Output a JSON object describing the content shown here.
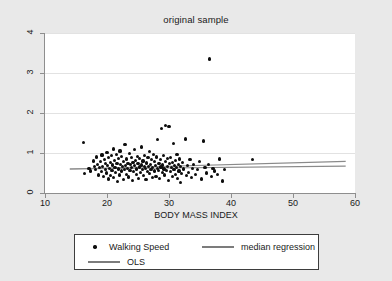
{
  "chart_data": {
    "type": "scatter",
    "title": "original sample",
    "xlabel": "BODY MASS INDEX",
    "ylabel": "",
    "xlim": [
      10,
      60
    ],
    "ylim": [
      0,
      4
    ],
    "xticks": [
      "10",
      "20",
      "30",
      "40",
      "50",
      "60"
    ],
    "yticks": [
      "0",
      "1",
      "2",
      "3",
      "4"
    ],
    "grid": "horizontal",
    "legend_position": "below-plot",
    "series": [
      {
        "name": "Walking Speed",
        "marker": "filled-circle",
        "color": "#0d0d0d",
        "points": [
          [
            16.2,
            1.27
          ],
          [
            16.4,
            0.49
          ],
          [
            17.1,
            0.62
          ],
          [
            17.4,
            0.55
          ],
          [
            17.8,
            0.8
          ],
          [
            18.0,
            0.67
          ],
          [
            18.2,
            0.58
          ],
          [
            18.3,
            0.9
          ],
          [
            18.5,
            0.72
          ],
          [
            18.6,
            0.45
          ],
          [
            18.8,
            0.63
          ],
          [
            19.0,
            0.78
          ],
          [
            19.1,
            0.53
          ],
          [
            19.2,
            0.95
          ],
          [
            19.3,
            0.66
          ],
          [
            19.5,
            0.41
          ],
          [
            19.6,
            0.84
          ],
          [
            19.7,
            0.59
          ],
          [
            19.8,
            0.73
          ],
          [
            19.9,
            0.5
          ],
          [
            20.0,
            1.02
          ],
          [
            20.1,
            0.69
          ],
          [
            20.2,
            0.88
          ],
          [
            20.3,
            0.35
          ],
          [
            20.4,
            0.61
          ],
          [
            20.5,
            0.76
          ],
          [
            20.6,
            0.44
          ],
          [
            20.7,
            0.93
          ],
          [
            20.8,
            0.57
          ],
          [
            20.9,
            0.7
          ],
          [
            21.0,
            1.1
          ],
          [
            21.1,
            0.38
          ],
          [
            21.2,
            0.82
          ],
          [
            21.3,
            0.64
          ],
          [
            21.4,
            0.51
          ],
          [
            21.5,
            0.97
          ],
          [
            21.6,
            0.74
          ],
          [
            21.7,
            0.29
          ],
          [
            21.8,
            0.86
          ],
          [
            21.9,
            0.6
          ],
          [
            22.0,
            0.45
          ],
          [
            22.1,
            1.05
          ],
          [
            22.2,
            0.71
          ],
          [
            22.3,
            0.55
          ],
          [
            22.4,
            0.91
          ],
          [
            22.5,
            0.66
          ],
          [
            22.6,
            0.33
          ],
          [
            22.7,
            0.79
          ],
          [
            22.8,
            0.58
          ],
          [
            22.9,
            1.21
          ],
          [
            23.0,
            0.68
          ],
          [
            23.1,
            0.47
          ],
          [
            23.2,
            0.85
          ],
          [
            23.3,
            0.62
          ],
          [
            23.4,
            0.74
          ],
          [
            23.5,
            0.4
          ],
          [
            23.6,
            0.99
          ],
          [
            23.7,
            0.56
          ],
          [
            23.8,
            0.71
          ],
          [
            23.9,
            0.88
          ],
          [
            24.0,
            0.63
          ],
          [
            24.1,
            0.31
          ],
          [
            24.2,
            0.77
          ],
          [
            24.3,
            0.54
          ],
          [
            24.4,
            1.08
          ],
          [
            24.5,
            0.69
          ],
          [
            24.6,
            0.82
          ],
          [
            24.7,
            0.46
          ],
          [
            24.8,
            0.6
          ],
          [
            24.9,
            0.92
          ],
          [
            25.0,
            0.73
          ],
          [
            25.1,
            0.37
          ],
          [
            25.2,
            0.65
          ],
          [
            25.3,
            0.86
          ],
          [
            25.4,
            0.52
          ],
          [
            25.5,
            1.15
          ],
          [
            25.6,
            0.7
          ],
          [
            25.7,
            0.58
          ],
          [
            25.8,
            0.8
          ],
          [
            25.9,
            0.43
          ],
          [
            26.0,
            0.67
          ],
          [
            26.1,
            0.94
          ],
          [
            26.2,
            0.61
          ],
          [
            26.3,
            0.34
          ],
          [
            26.4,
            0.75
          ],
          [
            26.5,
            0.53
          ],
          [
            26.6,
            0.88
          ],
          [
            26.7,
            0.66
          ],
          [
            26.8,
            1.03
          ],
          [
            26.9,
            0.48
          ],
          [
            27.0,
            0.72
          ],
          [
            27.1,
            0.59
          ],
          [
            27.2,
            0.84
          ],
          [
            27.3,
            0.39
          ],
          [
            27.4,
            0.64
          ],
          [
            27.5,
            0.97
          ],
          [
            27.6,
            0.55
          ],
          [
            27.7,
            0.78
          ],
          [
            27.8,
            0.68
          ],
          [
            27.9,
            0.42
          ],
          [
            28.0,
            0.9
          ],
          [
            28.1,
            0.62
          ],
          [
            28.2,
            1.33
          ],
          [
            28.3,
            0.57
          ],
          [
            28.4,
            0.74
          ],
          [
            28.5,
            0.36
          ],
          [
            28.6,
            0.83
          ],
          [
            28.7,
            0.65
          ],
          [
            28.8,
            1.62
          ],
          [
            28.9,
            0.51
          ],
          [
            29.0,
            0.7
          ],
          [
            29.1,
            0.93
          ],
          [
            29.2,
            0.6
          ],
          [
            29.3,
            0.45
          ],
          [
            29.4,
            0.79
          ],
          [
            29.5,
            1.68
          ],
          [
            29.6,
            0.56
          ],
          [
            29.7,
            0.86
          ],
          [
            29.8,
            0.67
          ],
          [
            29.9,
            0.32
          ],
          [
            30.0,
            1.67
          ],
          [
            30.1,
            0.73
          ],
          [
            30.2,
            0.54
          ],
          [
            30.3,
            0.89
          ],
          [
            30.4,
            0.63
          ],
          [
            30.5,
            0.41
          ],
          [
            30.6,
            0.76
          ],
          [
            30.7,
            1.24
          ],
          [
            30.8,
            0.58
          ],
          [
            30.9,
            0.69
          ],
          [
            31.0,
            0.47
          ],
          [
            31.1,
            0.81
          ],
          [
            31.2,
            0.64
          ],
          [
            31.3,
            0.96
          ],
          [
            31.4,
            0.37
          ],
          [
            31.5,
            0.71
          ],
          [
            31.6,
            0.55
          ],
          [
            31.7,
            0.85
          ],
          [
            31.8,
            0.27
          ],
          [
            31.9,
            0.66
          ],
          [
            32.0,
            0.49
          ],
          [
            32.2,
            0.77
          ],
          [
            32.4,
            0.6
          ],
          [
            32.6,
            1.35
          ],
          [
            32.8,
            0.44
          ],
          [
            33.0,
            0.68
          ],
          [
            33.2,
            0.52
          ],
          [
            33.4,
            0.83
          ],
          [
            33.6,
            0.38
          ],
          [
            33.8,
            0.62
          ],
          [
            34.0,
            0.71
          ],
          [
            34.3,
            0.46
          ],
          [
            34.6,
            0.58
          ],
          [
            34.9,
            0.79
          ],
          [
            35.2,
            0.35
          ],
          [
            35.5,
            1.3
          ],
          [
            35.8,
            0.64
          ],
          [
            36.1,
            0.5
          ],
          [
            36.4,
            0.72
          ],
          [
            36.5,
            3.35
          ],
          [
            36.8,
            0.42
          ],
          [
            37.1,
            0.61
          ],
          [
            37.4,
            0.55
          ],
          [
            37.8,
            0.47
          ],
          [
            38.2,
            0.85
          ],
          [
            38.6,
            0.3
          ],
          [
            39.0,
            0.58
          ],
          [
            43.5,
            0.83
          ]
        ]
      }
    ],
    "lines": [
      {
        "name": "median regression",
        "color": "#8a8a8a",
        "x": [
          14,
          58.5
        ],
        "y": [
          0.6,
          0.67
        ]
      },
      {
        "name": "OLS",
        "color": "#8a8a8a",
        "x": [
          14,
          58.5
        ],
        "y": [
          0.6,
          0.79
        ]
      }
    ]
  },
  "legend": {
    "items": [
      {
        "key": "marker",
        "label": "Walking Speed"
      },
      {
        "key": "line",
        "label": "median regression"
      },
      {
        "key": "line",
        "label": "OLS"
      }
    ]
  }
}
